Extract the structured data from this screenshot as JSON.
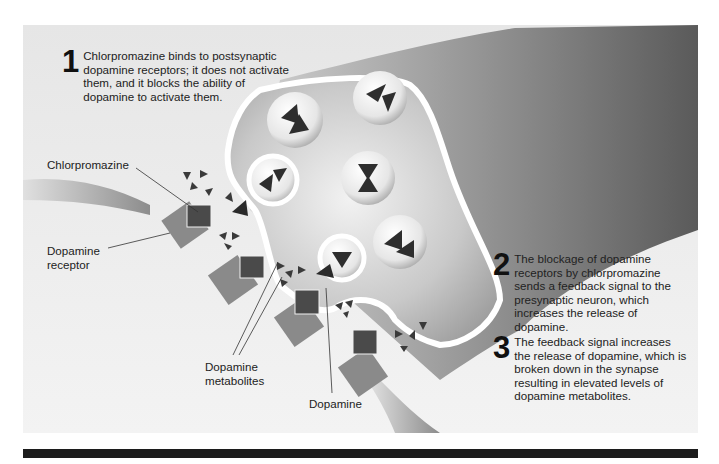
{
  "steps": [
    {
      "number": "1",
      "text": "Chlorpromazine binds to postsynaptic dopamine receptors; it does not activate them, and it blocks the ability of dopamine to activate them."
    },
    {
      "number": "2",
      "text": "The blockage of dopamine receptors by chlorpromazine sends a feedback signal to the presynaptic neuron, which increases the release of dopamine."
    },
    {
      "number": "3",
      "text": "The feedback signal increases the release of dopamine, which is broken down in the synapse resulting in elevated levels of dopamine metabolites."
    }
  ],
  "labels": {
    "chlorpromazine": "Chlorpromazine",
    "dopamine_receptor_line1": "Dopamine",
    "dopamine_receptor_line2": "receptor",
    "metabolites_line1": "Dopamine",
    "metabolites_line2": "metabolites",
    "dopamine": "Dopamine"
  },
  "colors": {
    "panel_bg": "#e9e9e9",
    "neuron_dark": "#6e6e6e",
    "receptor": "#8a8a8a",
    "chlorpromazine": "#4a4a4a",
    "molecule": "#2e2e2e",
    "bar": "#1c1c1c"
  }
}
